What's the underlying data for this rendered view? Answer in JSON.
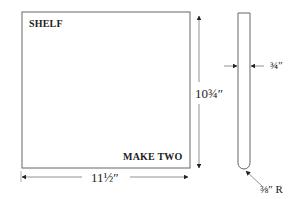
{
  "diagram": {
    "type": "woodworking-part-drawing",
    "part_name": "SHELF",
    "quantity_note": "MAKE TWO",
    "dimensions": {
      "width": "11½″",
      "height": "10¾″",
      "thickness": "¾″",
      "edge_radius": "⅜″ R"
    },
    "views": [
      "front-view",
      "side-view"
    ]
  },
  "colors": {
    "line": "#555555",
    "text": "#222222",
    "background": "#ffffff"
  }
}
